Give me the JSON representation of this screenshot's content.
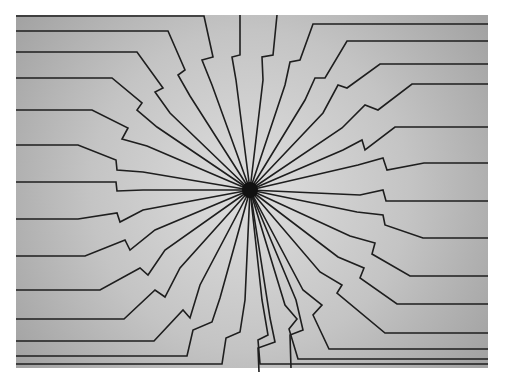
{
  "figure": {
    "substrate": {
      "x": 16,
      "y": 15,
      "width": 472,
      "height": 353,
      "center_color": "#dcdcdc",
      "edge_color": "#a6a6a6"
    },
    "hub": {
      "cx": 250,
      "cy": 190,
      "r": 8,
      "color": "#111111"
    },
    "trace_color": "#1e1e1e",
    "traces": [
      {
        "id": "L1",
        "points": "16,16 204,16 213,57 202,60 212,85 250,190"
      },
      {
        "id": "L2",
        "points": "16,31 168,31 185,70 178,75 190,96 250,190"
      },
      {
        "id": "L3",
        "points": "16,52 137,52 163,88 155,92 170,113 250,190"
      },
      {
        "id": "L4",
        "points": "16,78 112,78 142,103 137,110 157,127 250,190"
      },
      {
        "id": "L5",
        "points": "16,110 92,110 128,128 122,139 147,146 250,190"
      },
      {
        "id": "L6",
        "points": "16,145 78,145 116,160 117,170 143,172 250,190"
      },
      {
        "id": "L7",
        "points": "16,182 116,182 117,191 143,190 250,190"
      },
      {
        "id": "L8",
        "points": "16,219 78,219 117,213 120,222 143,210 250,190"
      },
      {
        "id": "L9",
        "points": "16,256 85,256 125,240 130,250 155,230 250,190"
      },
      {
        "id": "L10",
        "points": "16,290 100,290 140,268 148,275 165,250 250,190"
      },
      {
        "id": "L11",
        "points": "16,319 124,319 155,290 165,297 180,268 250,190"
      },
      {
        "id": "L12",
        "points": "16,341 154,341 183,310 190,318 200,285 250,190"
      },
      {
        "id": "L13",
        "points": "16,356 187,356 193,330 212,322 220,298 250,190"
      },
      {
        "id": "L14",
        "points": "16,364 222,364 226,338 240,332 245,300 250,190"
      },
      {
        "id": "T1",
        "points": "240,15 240,55 232,57 236,80 250,190"
      },
      {
        "id": "T2",
        "points": "277,15 273,55 262,57 263,80 250,190"
      },
      {
        "id": "B1",
        "points": "259,372 258,348 275,342 270,318 250,190"
      },
      {
        "id": "B2",
        "points": "291,368 290,335 303,330 296,300 250,190"
      },
      {
        "id": "R1",
        "points": "488,24 313,24 300,60 290,62 285,85 250,190"
      },
      {
        "id": "R2",
        "points": "488,41 347,41 325,78 315,78 305,100 250,190"
      },
      {
        "id": "R3",
        "points": "488,64 380,64 347,88 338,85 323,113 250,190"
      },
      {
        "id": "R4",
        "points": "488,84 412,84 378,110 365,105 342,128 250,190"
      },
      {
        "id": "R5",
        "points": "488,127 395,127 365,150 362,140 343,150 250,190"
      },
      {
        "id": "R6",
        "points": "488,163 424,163 387,170 383,158 358,165 250,190"
      },
      {
        "id": "R7",
        "points": "488,201 386,201 383,190 360,195 250,190"
      },
      {
        "id": "R8",
        "points": "488,238 423,238 385,225 383,215 357,212 250,190"
      },
      {
        "id": "R9",
        "points": "488,276 410,276 372,254 375,243 350,236 250,190"
      },
      {
        "id": "R10",
        "points": "488,304 397,304 360,278 364,268 338,257 250,190"
      },
      {
        "id": "R11",
        "points": "488,333 385,333 337,293 342,285 320,272 250,190"
      },
      {
        "id": "R12",
        "points": "488,349 329,349 313,315 322,305 303,290 250,190"
      },
      {
        "id": "R13",
        "points": "488,359 298,359 289,329 297,319 285,305 250,190"
      },
      {
        "id": "R14",
        "points": "488,364 260,364 258,340 268,335 262,300 250,190"
      }
    ]
  }
}
